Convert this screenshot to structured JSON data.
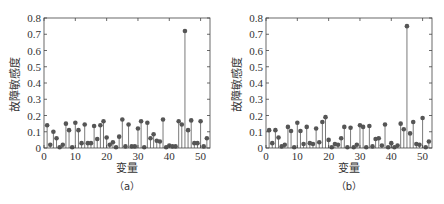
{
  "chart_data": [
    {
      "type": "stem",
      "panel": "a",
      "caption": "（a）",
      "title": "",
      "xlabel": "变量",
      "ylabel": "故障敏感度",
      "xlim": [
        0,
        53
      ],
      "ylim": [
        0,
        0.8
      ],
      "xticks": [
        0,
        10,
        20,
        30,
        40,
        50
      ],
      "yticks": [
        0,
        0.1,
        0.2,
        0.3,
        0.4,
        0.5,
        0.6,
        0.7,
        0.8
      ],
      "grid": false,
      "x": [
        1,
        2,
        3,
        4,
        5,
        6,
        7,
        8,
        9,
        10,
        11,
        12,
        13,
        14,
        15,
        16,
        17,
        18,
        19,
        20,
        21,
        22,
        23,
        24,
        25,
        26,
        27,
        28,
        29,
        30,
        31,
        32,
        33,
        34,
        35,
        36,
        37,
        38,
        39,
        40,
        41,
        42,
        43,
        44,
        45,
        46,
        47,
        48,
        49,
        50,
        51,
        52
      ],
      "values": [
        0.14,
        0.02,
        0.1,
        0.06,
        0.005,
        0.02,
        0.15,
        0.11,
        0.005,
        0.155,
        0.11,
        0.03,
        0.145,
        0.03,
        0.03,
        0.135,
        0.055,
        0.14,
        0.165,
        0.065,
        0.02,
        0.035,
        0.005,
        0.07,
        0.175,
        0.01,
        0.145,
        0.01,
        0.01,
        0.12,
        0.165,
        0.005,
        0.155,
        0.06,
        0.085,
        0.045,
        0.04,
        0.175,
        0.005,
        0.015,
        0.01,
        0.01,
        0.165,
        0.145,
        0.72,
        0.11,
        0.17,
        0.03,
        0.03,
        0.165,
        0.01,
        0.06
      ]
    },
    {
      "type": "stem",
      "panel": "b",
      "caption": "（b）",
      "title": "",
      "xlabel": "变量",
      "ylabel": "故障敏感度",
      "xlim": [
        0,
        53
      ],
      "ylim": [
        0,
        0.8
      ],
      "xticks": [
        0,
        10,
        20,
        30,
        40,
        50
      ],
      "yticks": [
        0,
        0.1,
        0.2,
        0.3,
        0.4,
        0.5,
        0.6,
        0.7,
        0.8
      ],
      "grid": false,
      "x": [
        1,
        2,
        3,
        4,
        5,
        6,
        7,
        8,
        9,
        10,
        11,
        12,
        13,
        14,
        15,
        16,
        17,
        18,
        19,
        20,
        21,
        22,
        23,
        24,
        25,
        26,
        27,
        28,
        29,
        30,
        31,
        32,
        33,
        34,
        35,
        36,
        37,
        38,
        39,
        40,
        41,
        42,
        43,
        44,
        45,
        46,
        47,
        48,
        49,
        50,
        51,
        52
      ],
      "values": [
        0.11,
        0.03,
        0.11,
        0.065,
        0.01,
        0.02,
        0.13,
        0.105,
        0.005,
        0.155,
        0.105,
        0.025,
        0.13,
        0.03,
        0.025,
        0.12,
        0.035,
        0.16,
        0.19,
        0.05,
        0.005,
        0.025,
        0.02,
        0.06,
        0.13,
        0.005,
        0.125,
        0.005,
        0.02,
        0.14,
        0.13,
        0.005,
        0.135,
        0.01,
        0.055,
        0.06,
        0.015,
        0.145,
        0.005,
        0.03,
        0.005,
        0.015,
        0.15,
        0.115,
        0.75,
        0.09,
        0.16,
        0.025,
        0.02,
        0.185,
        0.005,
        0.04
      ]
    }
  ],
  "colors": {
    "stem": "#7a7a7a",
    "marker": "#555555",
    "axis": "#444444",
    "text": "#333333"
  },
  "panels": [
    {
      "caption": "（a）",
      "xlabel": "变量",
      "ylabel": "故障敏感度"
    },
    {
      "caption": "（b）",
      "xlabel": "变量",
      "ylabel": "故障敏感度"
    }
  ]
}
